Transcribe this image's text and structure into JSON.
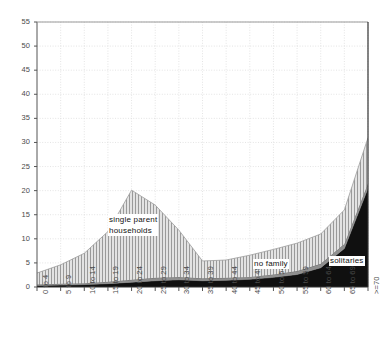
{
  "chart_data": {
    "type": "area",
    "stacked": true,
    "title": "",
    "xlabel": "",
    "ylabel": "",
    "ylim": [
      0,
      55
    ],
    "ytick_step": 5,
    "grid": true,
    "legend_position": "inline-annotations",
    "categories": [
      "0 to 4",
      "5 to 9",
      "10 to 14",
      "15 to 19",
      "20 to 24",
      "25 to 29",
      "30 to 34",
      "35 to 39",
      "40 to 44",
      "45 to 49",
      "50 to 54",
      "55 to 59",
      "60 to 64",
      "65 to 69",
      ">=70"
    ],
    "yticks": [
      0,
      5,
      10,
      15,
      20,
      25,
      30,
      35,
      40,
      45,
      50,
      55
    ],
    "series": [
      {
        "name": "solitaries",
        "fill": "#101010",
        "values": [
          0.3,
          0.4,
          0.5,
          0.7,
          1.0,
          1.3,
          1.5,
          1.3,
          1.4,
          1.6,
          2.0,
          2.6,
          4.0,
          8.0,
          20.5
        ]
      },
      {
        "name": "no family",
        "fill": "#8f8f8f",
        "values": [
          0.2,
          0.3,
          0.3,
          0.4,
          0.5,
          0.6,
          0.6,
          0.5,
          0.5,
          0.5,
          0.6,
          0.7,
          0.8,
          0.9,
          1.0
        ]
      },
      {
        "name": "single parent households",
        "fill": "#d2d2d2",
        "hatch": "vertical-lines",
        "values": [
          2.4,
          3.9,
          6.2,
          10.4,
          18.6,
          15.1,
          9.7,
          3.6,
          3.7,
          4.5,
          5.2,
          5.8,
          6.2,
          7.1,
          9.5
        ]
      }
    ],
    "totals": [
      2.9,
      4.6,
      7.0,
      11.5,
      20.1,
      17.0,
      11.8,
      5.4,
      5.6,
      6.6,
      7.8,
      9.1,
      11.0,
      16.0,
      31.0
    ],
    "annotations": [
      {
        "name": "single-parent-households",
        "text_line1": "single parent",
        "text_line2": "households",
        "x_px": 108,
        "y_px": 214
      },
      {
        "name": "no-family",
        "text_line1": "no family",
        "text_line2": "",
        "x_px": 253,
        "y_px": 259
      },
      {
        "name": "solitaries",
        "text_line1": "solitaries",
        "text_line2": "",
        "x_px": 329,
        "y_px": 256
      }
    ]
  },
  "axes": {
    "y_labels": [
      "55",
      "50",
      "45",
      "40",
      "35",
      "30",
      "25",
      "20",
      "15",
      "10",
      "5",
      "0"
    ],
    "x_labels": [
      "0 to 4",
      "5 to 9",
      "10 to 14",
      "15 to 19",
      "20 to 24",
      "25 to 29",
      "30 to 34",
      "35 to 39",
      "40 to 44",
      "45 to 49",
      "50 to 54",
      "55 to 59",
      "60 to 64",
      "65 to 69",
      ">=70"
    ]
  },
  "colors": {
    "grid": "#d8d8d8",
    "axis": "#555555",
    "frame": "#333333",
    "background": "#ffffff",
    "solitaries": "#101010",
    "no_family": "#8f8f8f",
    "single_parent": "#d2d2d2"
  }
}
